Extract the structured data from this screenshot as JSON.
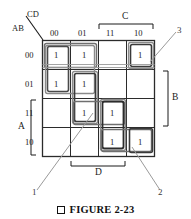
{
  "figure": {
    "caption_marker": "□",
    "caption_text": "FIGURE 2-23",
    "corner_label_top": "CD",
    "corner_label_bottom": "AB"
  },
  "kmap": {
    "type": "karnaugh-map",
    "variables": [
      "A",
      "B",
      "C",
      "D"
    ],
    "column_headers": [
      "00",
      "01",
      "11",
      "10"
    ],
    "row_headers": [
      "00",
      "01",
      "11",
      "10"
    ],
    "cell_one": "1",
    "cells": [
      [
        "1",
        "1",
        "",
        "1"
      ],
      [
        "1",
        "1",
        "",
        ""
      ],
      [
        "",
        "1",
        "1",
        ""
      ],
      [
        "",
        "",
        "1",
        "1"
      ]
    ],
    "brackets": {
      "C": {
        "label": "C",
        "spans_columns": [
          "11",
          "10"
        ]
      },
      "D": {
        "label": "D",
        "spans_columns": [
          "01",
          "11"
        ]
      },
      "B": {
        "label": "B",
        "spans_rows": [
          "01",
          "11"
        ]
      },
      "A": {
        "label": "A",
        "spans_rows": [
          "11",
          "10"
        ]
      }
    },
    "groups": [
      {
        "id": "g1",
        "note": "AB=00/01, CD=00 pair (left column, top two rows)"
      },
      {
        "id": "g2",
        "note": "AB=00, CD=00/01 pair (top row, left two cells)"
      },
      {
        "id": "g3",
        "note": "CD=01 column, AB=01/11 pair"
      },
      {
        "id": "g4",
        "note": "AB=11, CD=01/11 pair"
      },
      {
        "id": "g5",
        "note": "CD=11 column, AB=11/10 pair"
      },
      {
        "id": "g6",
        "note": "AB=10, CD=11/10 pair"
      },
      {
        "id": "g7",
        "note": "corner cell AB=00, CD=10"
      }
    ],
    "callouts": [
      {
        "label": "1",
        "target": "overlap near AB=11, CD=01"
      },
      {
        "label": "2",
        "target": "cell AB=10, CD=10"
      },
      {
        "label": "3",
        "target": "cell AB=00, CD=10"
      }
    ]
  },
  "colors": {
    "ink": "#1a1a1a",
    "grid": "#2b2b2b",
    "group_dark": "#2a2a2a",
    "group_mid": "#555555",
    "group_light": "#7d7d7d",
    "leader": "#888888"
  }
}
